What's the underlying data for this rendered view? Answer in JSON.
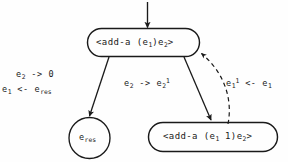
{
  "diagram": {
    "background_color": "#fefefe",
    "stroke_color": "#1a1a1a",
    "nodes": [
      {
        "id": "top",
        "shape": "stadium",
        "text": "<add-a (e1)e2>",
        "text_parts": {
          "prefix": "<add-a  (e",
          "sub1": "1",
          "mid": ")e",
          "sub2": "2",
          "suffix": ">"
        }
      },
      {
        "id": "result",
        "shape": "circle",
        "text": "e_res",
        "text_parts": {
          "prefix": "e",
          "sub1": "res"
        }
      },
      {
        "id": "recurse",
        "shape": "stadium",
        "text": "<add-a (e1 1)e2>",
        "text_parts": {
          "prefix": "<add-a  (e",
          "sub1": "1",
          "mid": " 1)e",
          "sub2": "2",
          "suffix": ">"
        }
      }
    ],
    "edges": [
      {
        "id": "entry",
        "style": "solid",
        "label": ""
      },
      {
        "id": "to-result",
        "style": "solid",
        "label_line1": "e2 -> 0",
        "label_line2": "e1 <- e_res"
      },
      {
        "id": "to-recurse",
        "style": "solid",
        "label": "e2 -> e2^1"
      },
      {
        "id": "back",
        "style": "dashed",
        "label": "e1^1 <- e1"
      }
    ],
    "labels": {
      "top_node": {
        "prefix": "<add-a  (e",
        "sub1": "1",
        "mid": ")e",
        "sub2": "2",
        "suffix": ">"
      },
      "circle_node": {
        "prefix": "e",
        "sub": "res"
      },
      "bottom_node": {
        "prefix": "<add-a  (e",
        "sub1": "1",
        "mid": " 1)e",
        "sub2": "2",
        "suffix": ">"
      },
      "left_edge": {
        "l1_a": "e",
        "l1_sub": "2",
        "l1_b": " -> 0",
        "l2_a": "e",
        "l2_sub": "1",
        "l2_b": " <- e",
        "l2_sub2": "res"
      },
      "mid_edge": {
        "a": "e",
        "sub_a": "2",
        "b": " -> e",
        "sub_b": "2",
        "sup_b": "1"
      },
      "right_edge": {
        "a": "e",
        "sub_a": "1",
        "sup_a": "1",
        "b": " <- e",
        "sub_b": "1"
      }
    }
  }
}
